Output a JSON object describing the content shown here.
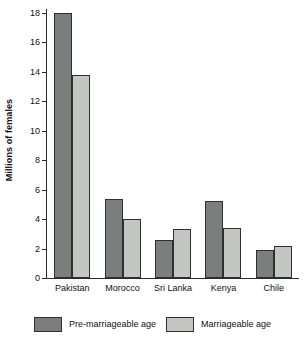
{
  "chart_data": {
    "type": "bar",
    "title": "",
    "xlabel": "",
    "ylabel": "Millions of females",
    "ylim": [
      0,
      18
    ],
    "ytick_step": 2,
    "grid": false,
    "legend_position": "bottom",
    "categories": [
      "Pakistan",
      "Morocco",
      "Sri Lanka",
      "Kenya",
      "Chile"
    ],
    "ytick_labels": [
      "0",
      "2",
      "4",
      "6",
      "8",
      "10",
      "12",
      "14",
      "16",
      "18"
    ],
    "series": [
      {
        "name": "Pre-marriageable age",
        "color": "#7b7e7c",
        "values": [
          18.0,
          5.4,
          2.6,
          5.2,
          1.9
        ]
      },
      {
        "name": "Marriageable age",
        "color": "#c4c6c4",
        "values": [
          13.8,
          4.0,
          3.3,
          3.4,
          2.2
        ]
      }
    ]
  },
  "axis": {
    "y_title": "Millions of females"
  },
  "legend": {
    "items": [
      {
        "label": "Pre-marriageable age"
      },
      {
        "label": "Marriageable age"
      }
    ]
  }
}
